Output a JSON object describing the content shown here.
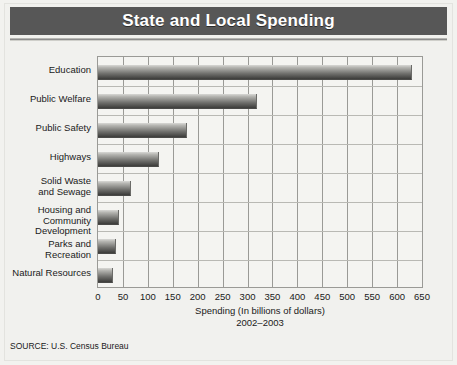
{
  "header": {
    "title": "State and Local Spending"
  },
  "source": "SOURCE: U.S. Census Bureau",
  "colors": {
    "title_band": "#575757",
    "title_text": "#ffffff",
    "page_background": "#f1f1ee",
    "plot_background": "#f4f4f1",
    "gridline": "#9a9a96",
    "bar_light": "#d8d8d5",
    "bar_dark": "#3c3c3a"
  },
  "chart_data": {
    "type": "bar",
    "orientation": "horizontal",
    "title": "State and Local Spending",
    "xlabel": "Spending (In billions of dollars)",
    "period": "2002–2003",
    "ylabel": "",
    "xlim": [
      0,
      650
    ],
    "xticks": [
      0,
      50,
      100,
      150,
      200,
      250,
      300,
      350,
      400,
      450,
      500,
      550,
      600,
      650
    ],
    "xtick_labels": [
      "0",
      "50",
      "100",
      "150",
      "200",
      "250",
      "300",
      "350",
      "400",
      "450",
      "500",
      "550",
      "600",
      "650"
    ],
    "grid": true,
    "legend": false,
    "categories": [
      "Education",
      "Public Welfare",
      "Public Safety",
      "Highways",
      "Solid Waste and Sewage",
      "Housing and Community Development",
      "Parks and Recreation",
      "Natural Resources"
    ],
    "category_label_lines": [
      [
        "Education"
      ],
      [
        "Public Welfare"
      ],
      [
        "Public Safety"
      ],
      [
        "Highways"
      ],
      [
        "Solid Waste",
        "and Sewage"
      ],
      [
        "Housing and",
        "Community Development"
      ],
      [
        "Parks and Recreation"
      ],
      [
        "Natural Resources"
      ]
    ],
    "values": [
      628,
      317,
      176,
      120,
      64,
      40,
      34,
      29
    ],
    "units": "billions of dollars"
  }
}
